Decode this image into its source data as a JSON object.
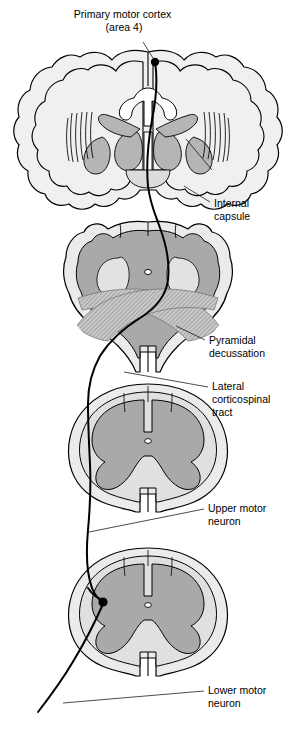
{
  "figure": {
    "width": 296,
    "height": 730,
    "background": "#ffffff"
  },
  "palette": {
    "white_matter": "#ebebeb",
    "gray_matter": "#a9a9a9",
    "gray_matter_light": "#bdbdbd",
    "cortex_fill": "#f0f0f0",
    "deep_nuclei": "#b5b5b5",
    "decussation_hatch": "#9e9e9e",
    "outline": "#000000",
    "text": "#000000",
    "axon": "#000000"
  },
  "labels": [
    {
      "id": "primary-motor-cortex",
      "lines": [
        "Primary motor cortex",
        "(area 4)"
      ],
      "x": 124,
      "y": 18,
      "align": "middle",
      "line_height": 13
    },
    {
      "id": "internal-capsule",
      "lines": [
        "Internal",
        "capsule"
      ],
      "x": 214,
      "y": 207,
      "align": "start",
      "line_height": 13
    },
    {
      "id": "pyramidal-decussation",
      "lines": [
        "Pyramidal",
        "decussation"
      ],
      "x": 209,
      "y": 344,
      "align": "start",
      "line_height": 13
    },
    {
      "id": "lateral-corticospinal-tract",
      "lines": [
        "Lateral",
        "corticospinal",
        "tract"
      ],
      "x": 212,
      "y": 390,
      "align": "start",
      "line_height": 13
    },
    {
      "id": "upper-motor-neuron",
      "lines": [
        "Upper motor",
        "neuron"
      ],
      "x": 208,
      "y": 512,
      "align": "start",
      "line_height": 13
    },
    {
      "id": "lower-motor-neuron",
      "lines": [
        "Lower motor",
        "neuron"
      ],
      "x": 208,
      "y": 694,
      "align": "start",
      "line_height": 13
    }
  ],
  "sections": [
    {
      "id": "coronal-brain",
      "name": "Coronal brain section",
      "center_y": 125
    },
    {
      "id": "medulla",
      "name": "Medulla with pyramidal decussation",
      "center_y": 285
    },
    {
      "id": "cervical-cord",
      "name": "Cervical spinal cord section",
      "center_y": 440
    },
    {
      "id": "lumbar-cord",
      "name": "Lumbar spinal cord section",
      "center_y": 605
    }
  ],
  "markers": [
    {
      "id": "cortex-origin",
      "name": "upper-motor-neuron-cell-body",
      "cx": 155,
      "cy": 62,
      "r": 4.2
    },
    {
      "id": "ventral-horn-synapse",
      "name": "lower-motor-neuron-cell-body",
      "cx": 103,
      "cy": 602,
      "r": 4.6
    }
  ]
}
